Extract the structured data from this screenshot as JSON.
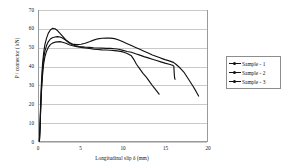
{
  "chart_data": {
    "type": "line",
    "title": "",
    "xlabel": "Longitudinal slip δ (mm)",
    "ylabel": "P / connector ( kN)",
    "xlim": [
      0,
      20
    ],
    "ylim": [
      0,
      70
    ],
    "xticks": [
      "0",
      "5",
      "10",
      "15",
      "20"
    ],
    "yticks": [
      "0",
      "10",
      "20",
      "30",
      "40",
      "50",
      "60",
      "70"
    ],
    "xtick_values": [
      0,
      5,
      10,
      15,
      20
    ],
    "ytick_values": [
      0,
      10,
      20,
      30,
      40,
      50,
      60,
      70
    ],
    "grid": "horizontal",
    "legend_position": "right",
    "line_color": "#111111",
    "grid_color": "#c9c9c9",
    "axis_color": "#9a9a9a",
    "series": [
      {
        "name": "Sample - 1",
        "points": [
          [
            0.05,
            0.0
          ],
          [
            0.12,
            8.0
          ],
          [
            0.2,
            20.0
          ],
          [
            0.3,
            32.0
          ],
          [
            0.42,
            41.0
          ],
          [
            0.55,
            47.0
          ],
          [
            0.7,
            51.5
          ],
          [
            0.9,
            55.0
          ],
          [
            1.1,
            57.5
          ],
          [
            1.35,
            59.3
          ],
          [
            1.6,
            60.2
          ],
          [
            1.9,
            60.0
          ],
          [
            2.2,
            59.0
          ],
          [
            2.5,
            57.5
          ],
          [
            2.8,
            56.0
          ],
          [
            3.2,
            54.0
          ],
          [
            3.6,
            52.6
          ],
          [
            4.0,
            51.8
          ],
          [
            4.5,
            51.5
          ],
          [
            5.0,
            51.7
          ],
          [
            5.5,
            52.2
          ],
          [
            6.0,
            53.0
          ],
          [
            6.5,
            53.9
          ],
          [
            7.0,
            54.6
          ],
          [
            7.5,
            54.9
          ],
          [
            8.0,
            55.0
          ],
          [
            8.5,
            55.0
          ],
          [
            9.0,
            54.7
          ],
          [
            9.5,
            54.0
          ],
          [
            10.0,
            53.0
          ],
          [
            10.5,
            52.0
          ],
          [
            11.0,
            51.0
          ],
          [
            11.5,
            50.0
          ],
          [
            12.0,
            49.0
          ],
          [
            12.5,
            48.0
          ],
          [
            13.0,
            47.0
          ],
          [
            13.5,
            46.0
          ],
          [
            14.0,
            45.2
          ],
          [
            14.5,
            44.3
          ],
          [
            15.0,
            43.5
          ],
          [
            15.5,
            42.8
          ],
          [
            16.0,
            42.0
          ],
          [
            16.3,
            41.0
          ],
          [
            16.8,
            39.0
          ],
          [
            17.3,
            36.5
          ],
          [
            17.8,
            33.0
          ],
          [
            18.3,
            29.5
          ],
          [
            18.7,
            26.5
          ],
          [
            19.0,
            24.0
          ]
        ]
      },
      {
        "name": "Sample - 2",
        "points": [
          [
            0.05,
            0.0
          ],
          [
            0.12,
            7.0
          ],
          [
            0.2,
            18.0
          ],
          [
            0.3,
            29.0
          ],
          [
            0.42,
            38.0
          ],
          [
            0.55,
            44.0
          ],
          [
            0.7,
            48.0
          ],
          [
            0.9,
            51.0
          ],
          [
            1.1,
            53.0
          ],
          [
            1.35,
            54.5
          ],
          [
            1.6,
            55.2
          ],
          [
            1.9,
            55.6
          ],
          [
            2.2,
            55.8
          ],
          [
            2.5,
            55.6
          ],
          [
            2.8,
            55.0
          ],
          [
            3.2,
            53.8
          ],
          [
            3.6,
            52.4
          ],
          [
            4.0,
            51.4
          ],
          [
            4.4,
            50.8
          ],
          [
            4.8,
            50.5
          ],
          [
            5.2,
            50.3
          ],
          [
            5.6,
            50.1
          ],
          [
            6.0,
            50.0
          ],
          [
            6.5,
            49.8
          ],
          [
            7.0,
            49.7
          ],
          [
            7.5,
            49.6
          ],
          [
            8.0,
            49.5
          ],
          [
            8.5,
            49.5
          ],
          [
            9.0,
            49.3
          ],
          [
            9.5,
            49.0
          ],
          [
            10.0,
            48.4
          ],
          [
            10.5,
            47.8
          ],
          [
            11.0,
            47.4
          ],
          [
            11.5,
            46.6
          ],
          [
            12.0,
            45.9
          ],
          [
            12.5,
            45.1
          ],
          [
            13.0,
            44.4
          ],
          [
            13.5,
            43.7
          ],
          [
            14.0,
            43.0
          ],
          [
            14.5,
            42.3
          ],
          [
            15.0,
            41.6
          ],
          [
            15.5,
            41.0
          ],
          [
            15.9,
            40.5
          ],
          [
            16.05,
            40.0
          ],
          [
            16.1,
            36.0
          ],
          [
            16.15,
            33.5
          ],
          [
            16.2,
            33.0
          ]
        ]
      },
      {
        "name": "Sample - 3",
        "points": [
          [
            0.05,
            0.0
          ],
          [
            0.12,
            6.5
          ],
          [
            0.2,
            17.0
          ],
          [
            0.3,
            27.0
          ],
          [
            0.42,
            35.0
          ],
          [
            0.55,
            41.0
          ],
          [
            0.7,
            45.0
          ],
          [
            0.9,
            48.0
          ],
          [
            1.1,
            50.0
          ],
          [
            1.35,
            51.5
          ],
          [
            1.6,
            52.3
          ],
          [
            1.9,
            52.8
          ],
          [
            2.2,
            53.0
          ],
          [
            2.5,
            53.1
          ],
          [
            2.8,
            52.8
          ],
          [
            3.2,
            52.2
          ],
          [
            3.6,
            51.4
          ],
          [
            4.0,
            50.9
          ],
          [
            4.5,
            50.4
          ],
          [
            5.0,
            50.0
          ],
          [
            5.5,
            49.7
          ],
          [
            6.0,
            49.4
          ],
          [
            6.5,
            49.1
          ],
          [
            7.0,
            48.9
          ],
          [
            7.5,
            48.7
          ],
          [
            8.0,
            48.6
          ],
          [
            8.5,
            48.5
          ],
          [
            9.0,
            48.3
          ],
          [
            9.5,
            48.0
          ],
          [
            10.0,
            47.6
          ],
          [
            10.5,
            46.8
          ],
          [
            11.0,
            45.5
          ],
          [
            11.3,
            43.5
          ],
          [
            11.6,
            41.0
          ],
          [
            12.0,
            38.5
          ],
          [
            12.4,
            36.0
          ],
          [
            12.8,
            34.0
          ],
          [
            13.2,
            31.5
          ],
          [
            13.6,
            29.0
          ],
          [
            14.0,
            26.8
          ],
          [
            14.3,
            25.0
          ]
        ]
      }
    ]
  },
  "legend": {
    "items": [
      {
        "label": "Sample - 1"
      },
      {
        "label": "Sample - 2"
      },
      {
        "label": "Sample - 3"
      }
    ]
  }
}
